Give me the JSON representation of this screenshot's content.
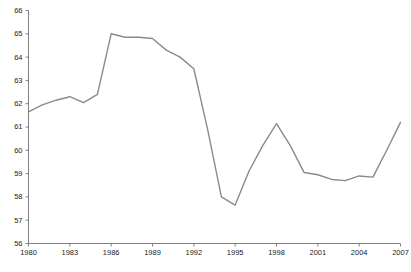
{
  "chart_data": {
    "type": "line",
    "title": "",
    "subtitle": "",
    "xlabel": "",
    "ylabel": "",
    "xlim": [
      1980,
      2007
    ],
    "ylim": [
      56,
      66
    ],
    "grid": false,
    "legend": null,
    "x_ticks": [
      "1980",
      "1983",
      "1986",
      "1989",
      "1992",
      "1995",
      "1998",
      "2001",
      "2004",
      "2007"
    ],
    "x_tick_values": [
      1980,
      1983,
      1986,
      1989,
      1992,
      1995,
      1998,
      2001,
      2004,
      2007
    ],
    "y_ticks": [
      "56",
      "57",
      "58",
      "59",
      "60",
      "61",
      "62",
      "63",
      "64",
      "65",
      "66"
    ],
    "y_tick_values": [
      56,
      57,
      58,
      59,
      60,
      61,
      62,
      63,
      64,
      65,
      66
    ],
    "line_color": "#8a8a8a",
    "axis_color": "#808080",
    "x": [
      1980,
      1981,
      1982,
      1983,
      1984,
      1985,
      1986,
      1987,
      1988,
      1989,
      1990,
      1991,
      1992,
      1993,
      1994,
      1995,
      1996,
      1997,
      1998,
      1999,
      2000,
      2001,
      2002,
      2003,
      2004,
      2005,
      2006,
      2007
    ],
    "values": [
      61.65,
      61.95,
      62.15,
      62.3,
      62.05,
      62.4,
      65.0,
      64.85,
      64.85,
      64.8,
      64.3,
      64.0,
      63.5,
      60.9,
      58.0,
      57.65,
      59.1,
      60.2,
      61.15,
      60.2,
      59.05,
      58.95,
      58.75,
      58.7,
      58.9,
      58.85,
      60.0,
      61.2
    ],
    "series": [
      {
        "name": "series-1",
        "values": [
          61.65,
          61.95,
          62.15,
          62.3,
          62.05,
          62.4,
          65.0,
          64.85,
          64.85,
          64.8,
          64.3,
          64.0,
          63.5,
          60.9,
          58.0,
          57.65,
          59.1,
          60.2,
          61.15,
          60.2,
          59.05,
          58.95,
          58.75,
          58.7,
          58.9,
          58.85,
          60.0,
          61.2
        ]
      }
    ]
  },
  "footer": {
    "caption": ""
  }
}
